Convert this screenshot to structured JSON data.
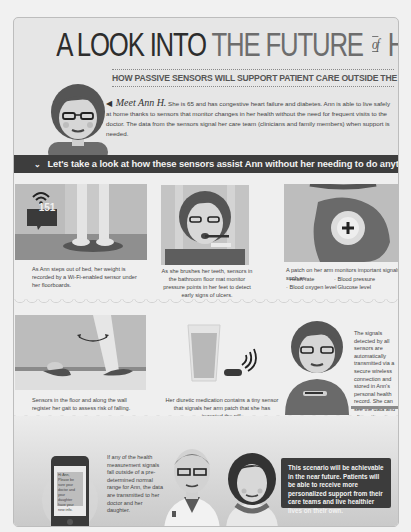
{
  "header": {
    "title_dark": "A LOOK INTO",
    "title_light_1": "THE FUTURE",
    "title_of": "of",
    "title_light_2": "HEALTH CARE",
    "subtitle": "HOW PASSIVE SENSORS WILL SUPPORT PATIENT CARE OUTSIDE THE HOSPITAL"
  },
  "intro": {
    "arrow": "◀",
    "meet": "Meet Ann H.",
    "text": "She is 65 and has congestive heart failure and diabetes. Ann is able to live safely at home thanks to sensors that monitor changes in her health without the need for frequent visits to the doctor. The data from the sensors signal her care team (clinicians and family members) when support is needed."
  },
  "banner": {
    "icon": "chevron-down-icon",
    "text": "Let's take a look at how these sensors assist Ann without her needing to do anything."
  },
  "scenes": [
    {
      "id": "scale",
      "display_value": "151",
      "caption": "As Ann steps out of bed, her weight is recorded by a Wi-Fi-enabled sensor under her floorboards."
    },
    {
      "id": "brushing",
      "caption": "As she brushes her teeth, sensors in the bathroom floor mat monitor pressure points in her feet to detect early signs of ulcers."
    },
    {
      "id": "patch",
      "caption": "A patch on her arm monitors important signals such as:",
      "bullets": [
        "Heart rate",
        "Blood pressure",
        "Blood oxygen level",
        "Glucose level"
      ]
    },
    {
      "id": "walking",
      "caption": "Sensors in the floor and along the wall register her gait to assess risk of falling."
    },
    {
      "id": "medication",
      "caption": "Her diuretic medication contains a tiny sensor that signals her arm patch that she has ingested the pill."
    },
    {
      "id": "transmit",
      "caption": "The signals detected by all sensors are automatically transmitted via a secure wireless connection and stored in Ann's personal health record. She can see the data and allow others to access it."
    }
  ],
  "bottom": {
    "phone_text": "Hi Ann, Please be sure your doctor and your daughter have your new info.",
    "alert_text": "If any of the health measurement signals fall outside of a pre-determined normal range for Ann, the data are transmitted to her doctor and her daughter.",
    "final_text": "This scenario will be achievable in the near future. Patients will be able to receive more personalized support from their care teams and live healthier lives on their own."
  },
  "colors": {
    "background": "#f1f1f1",
    "frame": "#e6e6e6",
    "banner": "#3d3d3d",
    "panel_gray": "#a7a7a7",
    "dark_gray": "#5a5a5a"
  }
}
